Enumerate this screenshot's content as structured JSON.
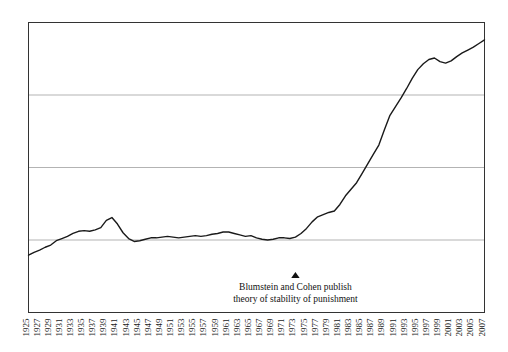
{
  "chart_data": {
    "type": "line",
    "title": "",
    "subtitle": "",
    "xlabel": "",
    "ylabel": "",
    "grid": true,
    "legend": false,
    "legend_position": "none",
    "xlim": [
      1925,
      2007
    ],
    "ylim": [
      0,
      4
    ],
    "y_gridlines": [
      1,
      2,
      3
    ],
    "line_color": "#1a1a1a",
    "frame_color": "#333333",
    "grid_color": "#b3b3b3",
    "tick_labels": [
      "1925",
      "1927",
      "1929",
      "1931",
      "1933",
      "1935",
      "1937",
      "1939",
      "1941",
      "1943",
      "1945",
      "1947",
      "1949",
      "1951",
      "1953",
      "1955",
      "1957",
      "1959",
      "1961",
      "1963",
      "1965",
      "1967",
      "1969",
      "1971",
      "1973",
      "1975",
      "1977",
      "1979",
      "1981",
      "1983",
      "1985",
      "1987",
      "1989",
      "1991",
      "1993",
      "1995",
      "1997",
      "1999",
      "2001",
      "2003",
      "2005",
      "2007"
    ],
    "x": [
      1925,
      1926,
      1927,
      1928,
      1929,
      1930,
      1931,
      1932,
      1933,
      1934,
      1935,
      1936,
      1937,
      1938,
      1939,
      1940,
      1941,
      1942,
      1943,
      1944,
      1945,
      1946,
      1947,
      1948,
      1949,
      1950,
      1951,
      1952,
      1953,
      1954,
      1955,
      1956,
      1957,
      1958,
      1959,
      1960,
      1961,
      1962,
      1963,
      1964,
      1965,
      1966,
      1967,
      1968,
      1969,
      1970,
      1971,
      1972,
      1973,
      1974,
      1975,
      1976,
      1977,
      1978,
      1979,
      1980,
      1981,
      1982,
      1983,
      1984,
      1985,
      1986,
      1987,
      1988,
      1989,
      1990,
      1991,
      1992,
      1993,
      1994,
      1995,
      1996,
      1997,
      1998,
      1999,
      2000,
      2001,
      2002,
      2003,
      2004,
      2005,
      2006,
      2007
    ],
    "values": [
      0.79,
      0.83,
      0.86,
      0.9,
      0.93,
      0.99,
      1.02,
      1.05,
      1.09,
      1.12,
      1.13,
      1.12,
      1.14,
      1.17,
      1.27,
      1.31,
      1.22,
      1.1,
      1.02,
      0.98,
      0.99,
      1.01,
      1.03,
      1.03,
      1.04,
      1.05,
      1.04,
      1.03,
      1.04,
      1.05,
      1.06,
      1.05,
      1.06,
      1.08,
      1.09,
      1.11,
      1.11,
      1.09,
      1.07,
      1.05,
      1.06,
      1.03,
      1.01,
      1.0,
      1.01,
      1.03,
      1.03,
      1.02,
      1.04,
      1.09,
      1.16,
      1.25,
      1.32,
      1.35,
      1.38,
      1.4,
      1.49,
      1.61,
      1.7,
      1.79,
      1.92,
      2.05,
      2.18,
      2.31,
      2.52,
      2.72,
      2.84,
      2.96,
      3.09,
      3.23,
      3.35,
      3.43,
      3.49,
      3.51,
      3.46,
      3.44,
      3.47,
      3.53,
      3.58,
      3.62,
      3.66,
      3.71,
      3.76
    ],
    "annotation": {
      "marker": "triangle-up",
      "marker_x": 1973,
      "line1": "Blumstein and Cohen publish",
      "line2": "theory of stability of punishment"
    }
  }
}
